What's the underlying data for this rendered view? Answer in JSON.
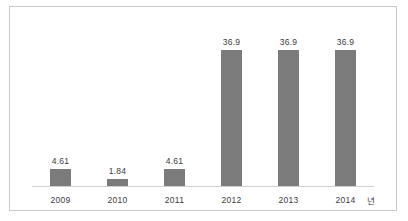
{
  "chart_data": {
    "type": "bar",
    "title": "",
    "subtitle": "",
    "xlabel": "",
    "ylabel": "",
    "axis_unit": "년",
    "categories": [
      "2009",
      "2010",
      "2011",
      "2012",
      "2013",
      "2014"
    ],
    "values": [
      4.61,
      1.84,
      4.61,
      36.9,
      36.9,
      36.9
    ],
    "value_labels": [
      "4.61",
      "1.84",
      "4.61",
      "36.9",
      "36.9",
      "36.9"
    ],
    "series": [
      {
        "name": "",
        "values": [
          4.61,
          1.84,
          4.61,
          36.9,
          36.9,
          36.9
        ]
      }
    ],
    "ylim": [
      0,
      44
    ],
    "grid": false,
    "legend": "none",
    "colors": {
      "bar": "#7b7b7b",
      "axis_line": "#cfcfcf",
      "frame_border": "#c9c9c9",
      "text": "#3b3b3b",
      "background": "#ffffff"
    }
  }
}
